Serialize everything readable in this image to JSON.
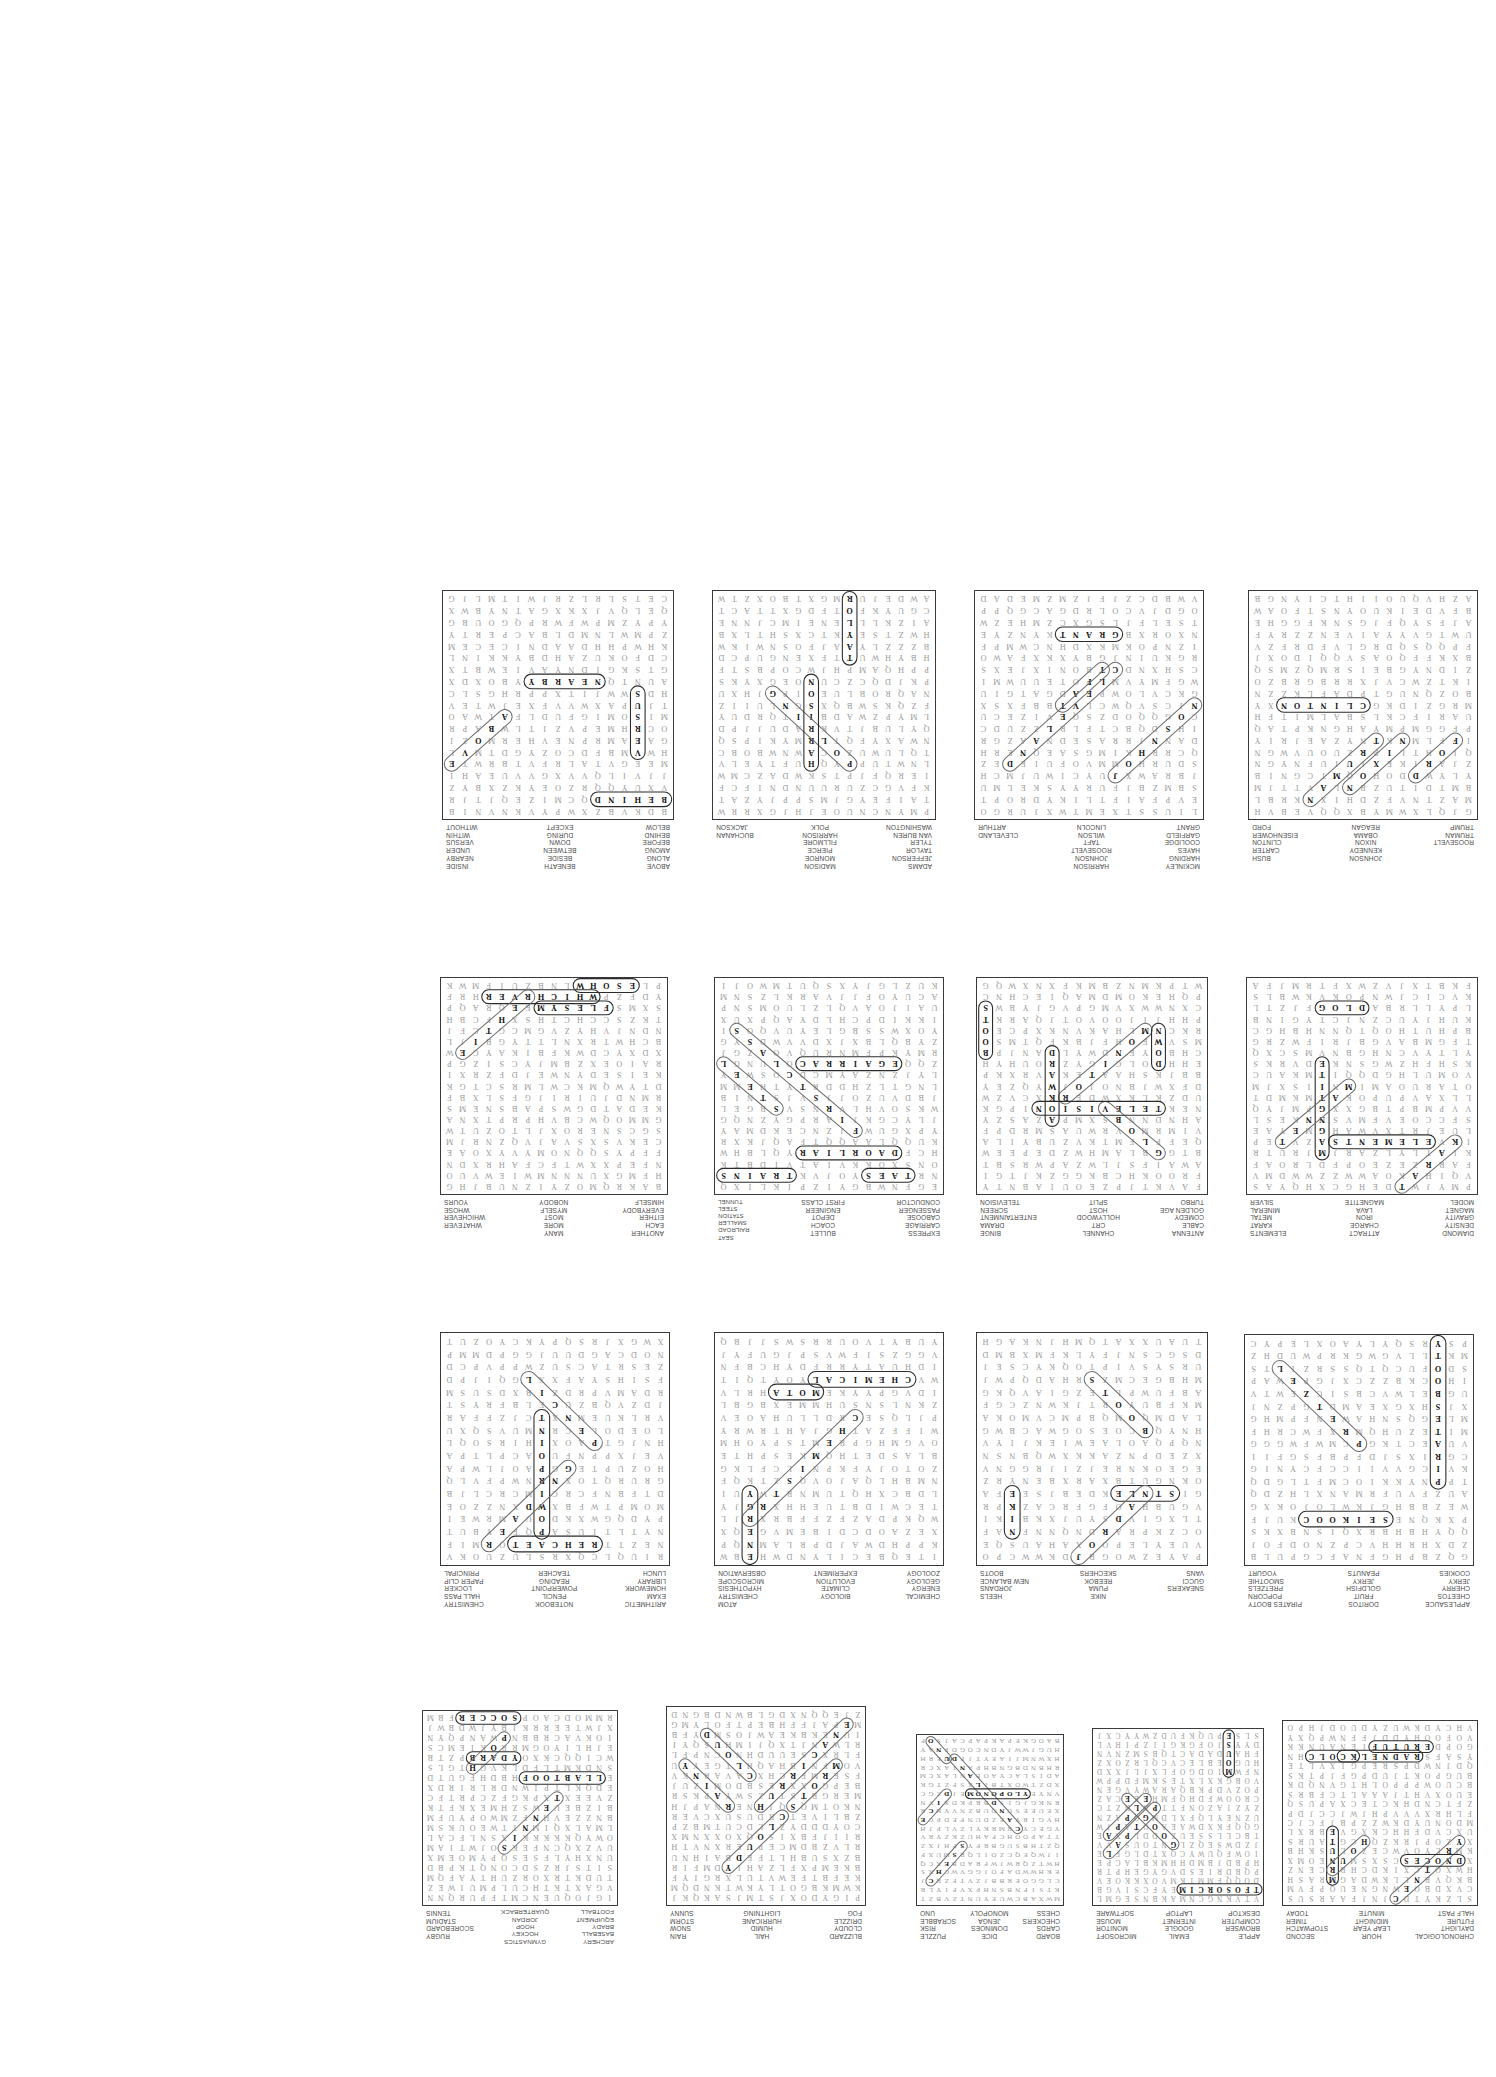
{
  "document": {
    "title": "Word Search Puzzle Answer Key Sheet",
    "orientation": "upside-down-scan",
    "rows": 4,
    "page_background": "#ffffff",
    "ink_color": "#9a9a9a",
    "found_word_color": "#111111",
    "grid_border_color": "#3a3a3a"
  },
  "puzzles": [
    {
      "id": "p1",
      "theme": "Time",
      "grid_cols": 18,
      "grid_rows": 19,
      "columns": [
        [
          "CHRONOLOGICAL",
          "DAYLIGHT",
          "FUTURE",
          "HALF PAST"
        ],
        [
          "HOUR",
          "LEAP YEAR",
          "MIDNIGHT",
          "MINUTE"
        ],
        [
          "SECOND",
          "STOPWATCH",
          "TIMER",
          "TODAY"
        ]
      ],
      "found": [
        "CALENDAR",
        "CENTURY",
        "MINUTE",
        "FUTURE",
        "HOUR",
        "SECOND",
        "CLOCK"
      ]
    },
    {
      "id": "p2",
      "theme": "Technology",
      "grid_cols": 18,
      "grid_rows": 19,
      "columns": [
        [
          "APPLE",
          "BROWSER",
          "COMPUTER",
          "DESKTOP"
        ],
        [
          "EMAIL",
          "GOOGLE",
          "INTERNET",
          "LAPTOP"
        ],
        [
          "MICROSOFT",
          "MONITOR",
          "MOUSE",
          "SOFTWARE"
        ]
      ],
      "found": [
        "LAPTOP",
        "GOOGLE",
        "MICROSOFT",
        "APPLE",
        "MOUSE"
      ]
    },
    {
      "id": "p3",
      "theme": "Games",
      "grid_cols": 18,
      "grid_rows": 19,
      "columns": [
        [
          "BOARD",
          "CARDS",
          "CHECKERS",
          "CHESS"
        ],
        [
          "DICE",
          "DOMINOES",
          "JENGA",
          "MONOPOLY"
        ],
        [
          "PUZZLE",
          "RISK",
          "SCRABBLE",
          "UNO"
        ]
      ],
      "found": [
        "CANDYLAND",
        "MONOPOLY",
        "CHESS",
        "UNO",
        "DICE"
      ]
    },
    {
      "id": "p4",
      "theme": "Weather",
      "grid_cols": 18,
      "grid_rows": 19,
      "columns": [
        [
          "BLIZZARD",
          "CLOUDY",
          "DRIZZLE",
          "FOG"
        ],
        [
          "HAIL",
          "HUMID",
          "HURRICANE",
          "LIGHTNING"
        ],
        [
          "RAIN",
          "SNOW",
          "STORM",
          "SUNNY"
        ]
      ],
      "found": [
        "CLOUD",
        "HURRICANE",
        "RAINY",
        "CLOUDY",
        "STORM"
      ]
    },
    {
      "id": "p5",
      "theme": "Sports",
      "grid_cols": 18,
      "grid_rows": 19,
      "columns": [
        [
          "ARCHERY",
          "BASEBALL",
          "BRADY",
          "EQUIPMENT",
          "FOOTBALL"
        ],
        [
          "GYMNASTICS",
          "HOCKEY",
          "HOOP",
          "JORDAN",
          "QUARTERBACK"
        ],
        [
          "RUGBY",
          "SCOREBOARD",
          "STADIUM",
          "TENNIS"
        ]
      ],
      "found": [
        "SOCCER",
        "HOOP",
        "TENNIS",
        "BRADY",
        "FOOTBALL"
      ]
    },
    {
      "id": "p6",
      "theme": "Snacks",
      "grid_cols": 17,
      "grid_rows": 18,
      "columns": [
        [
          "APPLESAUCE",
          "CHEETOS",
          "CHERRY",
          "JERKY",
          "COOKIES"
        ],
        [
          "DORITOS",
          "FRUIT",
          "GOLDFISH",
          "JERKY",
          "PEANUTS"
        ],
        [
          "PIRATES BOOTY",
          "POPCORN",
          "PRETZELS",
          "SMOOTHIE",
          "YOGURT"
        ]
      ],
      "found": [
        "PIRATES BOOTY",
        "COOKIES",
        "PRETZEL"
      ]
    },
    {
      "id": "p7",
      "theme": "Shoe Brands",
      "grid_cols": 17,
      "grid_rows": 18,
      "columns": [
        [
          "SNEAKERS",
          "GUCCI",
          "VANS"
        ],
        [
          "NIKE",
          "PUMA",
          "REEBOK",
          "SKECHERS"
        ],
        [
          "HEELS",
          "JORDANS",
          "NEW BALANCE",
          "BOOTS"
        ]
      ],
      "found": [
        "BOOTS",
        "NIKE",
        "STYLE",
        "JORDAN"
      ]
    },
    {
      "id": "p8",
      "theme": "Science",
      "grid_cols": 17,
      "grid_rows": 18,
      "columns": [
        [
          "CHEMICAL",
          "ENERGY",
          "GEOLOGY",
          "ZOOLOGY"
        ],
        [
          "BIOLOGY",
          "CLIMATE",
          "EVOLUTION",
          "EXPERIMENT"
        ],
        [
          "ATOM",
          "CHEMISTRY",
          "HYPOTHESIS",
          "MICROSCOPE",
          "OBSERVATION"
        ]
      ],
      "found": [
        "ATOM",
        "CHEMISTRY",
        "CHEMICAL",
        "ENERGY"
      ]
    },
    {
      "id": "p9",
      "theme": "School",
      "grid_cols": 17,
      "grid_rows": 18,
      "columns": [
        [
          "ARITHMETIC",
          "EXAM",
          "HOMEWORK",
          "LIBRARY",
          "LUNCH"
        ],
        [
          "NOTEBOOK",
          "PENCIL",
          "POWERPOINT",
          "READING",
          "TEACHER"
        ],
        [
          "CHEMISTRY",
          "HALL PASS",
          "LOCKER",
          "PAPER CLIP",
          "PRINCIPAL"
        ]
      ],
      "found": [
        "POWERPOINT",
        "READING",
        "TEACHER",
        "PENCIL"
      ]
    },
    {
      "id": "p10",
      "theme": "Physics",
      "grid_cols": 17,
      "grid_rows": 19,
      "columns": [
        [
          "DIAMOND",
          "DENSITY",
          "GRAVITY",
          "MAGNET",
          "MODEL"
        ],
        [
          "ATTRACT",
          "CHARGE",
          "IRON",
          "LAVA",
          "MAGNETITE"
        ],
        [
          "ELEMENTS",
          "KARAT",
          "METAL",
          "MINERAL",
          "SILVER"
        ]
      ],
      "found": [
        "KARAT",
        "MAGNETITE",
        "MAGNET",
        "ELEMENTS",
        "GOLD"
      ]
    },
    {
      "id": "p11",
      "theme": "Television",
      "grid_cols": 17,
      "grid_rows": 19,
      "columns": [
        [
          "ANTENNA",
          "CABLE",
          "COMEDY",
          "GOLDEN AGE",
          "TURBO"
        ],
        [
          "CHANNEL",
          "CRT",
          "HOLLYWOOD",
          "HOST",
          "SPLIT"
        ],
        [
          "BINGE",
          "DRAMA",
          "ENTERTAINMENT",
          "SCREEN",
          "TELEVISION"
        ]
      ],
      "found": [
        "BOOTS",
        "MONITOR",
        "DOWN",
        "AWKWARD",
        "GLOBE",
        "TELEVISION"
      ]
    },
    {
      "id": "p12",
      "theme": "Train Travel",
      "grid_cols": 17,
      "grid_rows": 19,
      "columns": [
        [
          "EXPRESS",
          "CARRIAGE",
          "CABOOSE",
          "PASSENGER",
          "CONDUCTOR"
        ],
        [
          "BULLET",
          "COACH",
          "DEPOT",
          "ENGINEER",
          "FIRST CLASS"
        ],
        [
          "SEAT",
          "RAILROAD",
          "SMALLER",
          "STATION",
          "STEEL",
          "TUNNEL"
        ]
      ],
      "found": [
        "STEEL",
        "TRAINS",
        "FIRST CLASS",
        "CARRIAGE",
        "RAILROAD",
        "SEAT"
      ]
    },
    {
      "id": "p13",
      "theme": "Indefinite Pronouns",
      "grid_cols": 17,
      "grid_rows": 19,
      "columns": [
        [
          "ANOTHER",
          "EACH",
          "EITHER",
          "EVERYBODY",
          "HIMSELF"
        ],
        [
          "MANY",
          "MORE",
          "MOST",
          "MYSELF",
          "NOBODY"
        ],
        [
          "WHATEVER",
          "WHICHEVER",
          "WHOSE",
          "YOURS"
        ]
      ],
      "found": [
        "WHICHEVER",
        "WHOSE",
        "MYSELF",
        "EITHER"
      ]
    },
    {
      "id": "p14",
      "theme": "Presidents 1",
      "grid_cols": 17,
      "grid_rows": 19,
      "columns": [
        [
          "ROOSEVELT",
          "TRUMAN",
          "TRUMP"
        ],
        [
          "JOHNSON",
          "KENNEDY",
          "NIXON",
          "OBAMA",
          "REAGAN"
        ],
        [
          "BUSH",
          "CARTER",
          "CLINTON",
          "EISENHOWER",
          "FORD"
        ]
      ],
      "found": [
        "CLINTON",
        "TRUMAN",
        "NIXON",
        "FORD"
      ]
    },
    {
      "id": "p15",
      "theme": "Presidents 2",
      "grid_cols": 17,
      "grid_rows": 19,
      "columns": [
        [
          "MCKINLEY",
          "HARDING",
          "HAYES",
          "COOLIDGE",
          "GARFIELD",
          "GRANT"
        ],
        [
          "HARRISON",
          "JOHNSON",
          "ROOSEVELT",
          "TAFT",
          "WILSON",
          "LINCOLN"
        ],
        [
          "CLEVELAND",
          "ARTHUR"
        ]
      ],
      "found": [
        "GRANT",
        "TAFT",
        "CLEVELAND",
        "JOHNSON"
      ]
    },
    {
      "id": "p16",
      "theme": "Presidents 3",
      "grid_cols": 17,
      "grid_rows": 19,
      "columns": [
        [
          "ADAMS",
          "JEFFERSON",
          "TAYLOR",
          "TYLER",
          "VAN BUREN",
          "WASHINGTON"
        ],
        [
          "MADISON",
          "MONROE",
          "PIERCE",
          "FILLMORE",
          "HARRISON",
          "POLK"
        ],
        [
          "BUCHANAN",
          "JACKSON"
        ]
      ],
      "found": [
        "POLLING",
        "HARRISON",
        "TAYLOR"
      ]
    },
    {
      "id": "p17",
      "theme": "Prepositions",
      "grid_cols": 17,
      "grid_rows": 19,
      "columns": [
        [
          "ABOVE",
          "ALONG",
          "AMONG",
          "BEFORE",
          "BEHIND",
          "BELOW"
        ],
        [
          "BENEATH",
          "BESIDE",
          "BETWEEN",
          "DOWN",
          "DURING",
          "EXCEPT"
        ],
        [
          "INSIDE",
          "NEARBY",
          "UNDER",
          "VERSUS",
          "WITHIN",
          "WITHOUT"
        ]
      ],
      "found": [
        "ABOVE",
        "NEARBY",
        "VERSUS",
        "BEHIND"
      ]
    }
  ]
}
